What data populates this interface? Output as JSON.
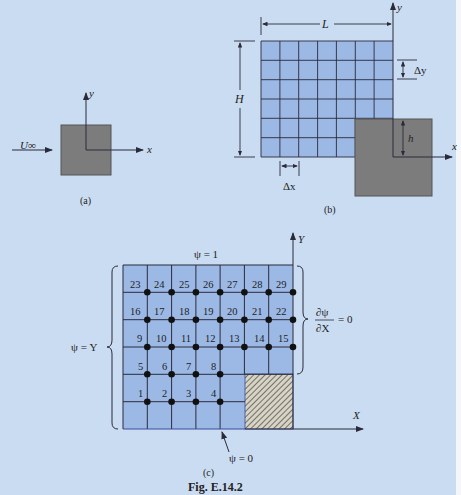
{
  "figure": {
    "caption": "Fig. E.14.2",
    "panels": {
      "a": {
        "label": "(a)",
        "freestream_label": "U∞",
        "x_axis": "x",
        "y_axis": "y"
      },
      "b": {
        "label": "(b)",
        "length_label": "L",
        "height_label": "H",
        "dx_label": "Δx",
        "dy_label": "Δy",
        "step_height_label": "h",
        "x_axis": "x",
        "y_axis": "y",
        "grid_cols": 7,
        "grid_rows": 6
      },
      "c": {
        "label": "(c)",
        "top_bc": "ψ = 1",
        "left_bc": "ψ = Y",
        "bottom_bc": "ψ = 0",
        "right_bc_num": "∂ψ",
        "right_bc_den": "∂X",
        "right_bc_eq": "= 0",
        "x_axis": "X",
        "y_axis": "Y",
        "grid_cols": 7,
        "grid_rows": 6,
        "node_rows": [
          [
            "23",
            "24",
            "25",
            "26",
            "27",
            "28",
            "29"
          ],
          [
            "16",
            "17",
            "18",
            "19",
            "20",
            "21",
            "22"
          ],
          [
            "9",
            "10",
            "11",
            "12",
            "13",
            "14",
            "15"
          ],
          [
            "5",
            "6",
            "7",
            "8"
          ],
          [
            "1",
            "2",
            "3",
            "4"
          ]
        ]
      }
    },
    "colors": {
      "background": "#cadcf1",
      "grid_fill": "#9cb9e6",
      "obstacle": "#7c7c7c",
      "line": "#2a2a3a"
    }
  }
}
